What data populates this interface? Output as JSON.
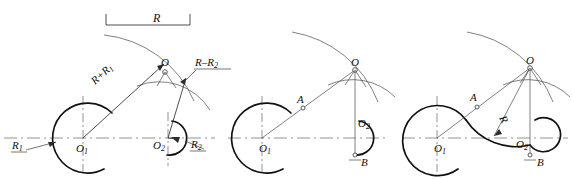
{
  "figure": {
    "panel_count": 3,
    "background_color": "#ffffff",
    "line_color": "#111111",
    "thin_line_color": "#555555",
    "axis_color": "#777777"
  },
  "panels": [
    {
      "id": "panel-left",
      "name": "panel-left",
      "labels": {
        "dimension_R": "R",
        "radius_sum": "R+R",
        "radius_sum_sub": "1",
        "radius_diff": "R–R",
        "radius_diff_sub": "2",
        "radius_one": "R",
        "radius_one_sub": "1",
        "radius_two": "R",
        "radius_two_sub": "2",
        "center_one": "O",
        "center_one_sub": "1",
        "center_two": "O",
        "center_two_sub": "2",
        "point_o": "O"
      }
    },
    {
      "id": "panel-middle",
      "name": "panel-middle",
      "labels": {
        "center_one": "O",
        "center_one_sub": "1",
        "center_two": "O",
        "center_two_sub": "2",
        "point_o": "O",
        "point_a": "A",
        "point_b": "B"
      }
    },
    {
      "id": "panel-right",
      "name": "panel-right",
      "labels": {
        "center_one": "O",
        "center_one_sub": "1",
        "center_two": "O",
        "center_two_sub": "2",
        "point_o": "O",
        "point_a": "A",
        "point_b": "B",
        "radius_R": "R"
      }
    }
  ]
}
